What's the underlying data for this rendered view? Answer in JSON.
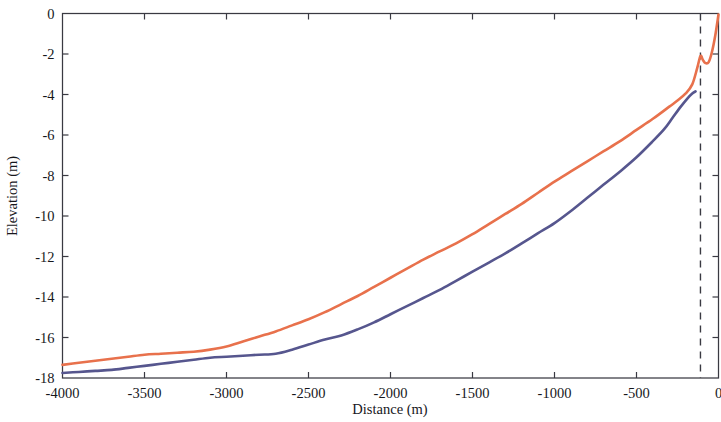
{
  "figure": {
    "background_color": "#ffffff",
    "frame_color": "#3a3a42"
  },
  "chart_data": {
    "type": "line",
    "title": "",
    "subtitle": "",
    "xlabel": "Distance (m)",
    "ylabel": "Elevation (m)",
    "xlim": [
      -4000,
      0
    ],
    "ylim": [
      -18,
      0
    ],
    "xticks": [
      -4000,
      -3500,
      -3000,
      -2500,
      -2000,
      -1500,
      -1000,
      -500,
      0
    ],
    "xtick_labels": [
      "-4000",
      "-3500",
      "-3000",
      "-2500",
      "-2000",
      "-1500",
      "-1000",
      "-500",
      "0"
    ],
    "yticks": [
      0,
      -2,
      -4,
      -6,
      -8,
      -10,
      -12,
      -14,
      -16,
      -18
    ],
    "ytick_labels": [
      "0",
      "-2",
      "-4",
      "-6",
      "-8",
      "-10",
      "-12",
      "-14",
      "-16",
      "-18"
    ],
    "grid": false,
    "legend": null,
    "legend_position": "none",
    "annotations": [
      {
        "name": "vertical-reference-line",
        "type": "vline",
        "x": -110,
        "style": "dashed",
        "color": "#3a3a42",
        "label": ""
      }
    ],
    "series": [
      {
        "name": "upper-profile",
        "color": "#e8714c",
        "x": [
          -4000,
          -3900,
          -3800,
          -3700,
          -3600,
          -3500,
          -3400,
          -3300,
          -3200,
          -3100,
          -3000,
          -2900,
          -2800,
          -2700,
          -2600,
          -2500,
          -2400,
          -2300,
          -2200,
          -2100,
          -2000,
          -1900,
          -1800,
          -1700,
          -1600,
          -1500,
          -1400,
          -1300,
          -1200,
          -1100,
          -1000,
          -900,
          -800,
          -700,
          -600,
          -500,
          -400,
          -300,
          -250,
          -200,
          -160,
          -130,
          -110,
          -95,
          -80,
          -60,
          -40,
          -20,
          0
        ],
        "values": [
          -17.35,
          -17.25,
          -17.15,
          -17.05,
          -16.95,
          -16.85,
          -16.8,
          -16.75,
          -16.7,
          -16.6,
          -16.45,
          -16.2,
          -15.95,
          -15.7,
          -15.4,
          -15.1,
          -14.75,
          -14.35,
          -13.95,
          -13.5,
          -13.05,
          -12.6,
          -12.15,
          -11.75,
          -11.35,
          -10.9,
          -10.4,
          -9.9,
          -9.4,
          -8.85,
          -8.3,
          -7.8,
          -7.3,
          -6.8,
          -6.3,
          -5.75,
          -5.2,
          -4.6,
          -4.3,
          -3.95,
          -3.5,
          -2.7,
          -2.1,
          -2.3,
          -2.45,
          -2.4,
          -1.9,
          -1.1,
          -0.05
        ]
      },
      {
        "name": "lower-profile",
        "color": "#56568e",
        "x": [
          -4000,
          -3900,
          -3800,
          -3700,
          -3600,
          -3500,
          -3400,
          -3300,
          -3200,
          -3100,
          -3000,
          -2900,
          -2800,
          -2700,
          -2600,
          -2500,
          -2400,
          -2300,
          -2200,
          -2100,
          -2000,
          -1900,
          -1800,
          -1700,
          -1600,
          -1500,
          -1400,
          -1300,
          -1200,
          -1100,
          -1000,
          -900,
          -800,
          -700,
          -600,
          -500,
          -400,
          -330,
          -280,
          -230,
          -190,
          -160,
          -140
        ],
        "values": [
          -17.75,
          -17.7,
          -17.65,
          -17.6,
          -17.5,
          -17.4,
          -17.3,
          -17.2,
          -17.1,
          -17.0,
          -16.95,
          -16.9,
          -16.85,
          -16.8,
          -16.6,
          -16.35,
          -16.1,
          -15.9,
          -15.6,
          -15.25,
          -14.85,
          -14.45,
          -14.05,
          -13.65,
          -13.2,
          -12.75,
          -12.3,
          -11.85,
          -11.35,
          -10.85,
          -10.35,
          -9.75,
          -9.1,
          -8.45,
          -7.8,
          -7.1,
          -6.3,
          -5.7,
          -5.15,
          -4.6,
          -4.2,
          -3.95,
          -3.85
        ]
      }
    ]
  }
}
